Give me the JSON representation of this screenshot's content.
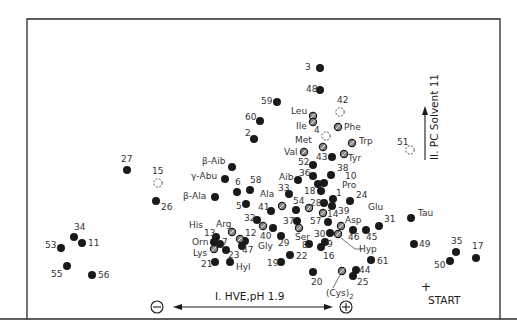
{
  "diagram": {
    "type": "two-dimensional amino acid fingerprint map (HVE x paper chromatography)",
    "axis_x": {
      "label": "I. HVE,pH 1.9",
      "negative_pole": "−",
      "positive_pole": "+"
    },
    "axis_y": {
      "label": "II. PC Solvent 11"
    },
    "origin": {
      "marker": "+",
      "label": "START"
    },
    "legend_styles": {
      "filled": "solid black spot",
      "hatched": "grey hatched spot (reference amino acids)",
      "dashed": "dotted outline spot (faint)"
    },
    "spots": [
      {
        "id": "3",
        "label": "3",
        "x": 320,
        "y": 68,
        "style": "filled",
        "lx": 305,
        "ly": 70
      },
      {
        "id": "48",
        "label": "48",
        "x": 320,
        "y": 90,
        "style": "filled",
        "lx": 306,
        "ly": 92
      },
      {
        "id": "59",
        "label": "59",
        "x": 277,
        "y": 102,
        "style": "filled",
        "lx": 261,
        "ly": 104
      },
      {
        "id": "60",
        "label": "60",
        "x": 260,
        "y": 121,
        "style": "filled",
        "lx": 245,
        "ly": 120
      },
      {
        "id": "2",
        "label": "2",
        "x": 254,
        "y": 139,
        "style": "filled",
        "lx": 245,
        "ly": 136
      },
      {
        "id": "42",
        "label": "42",
        "x": 340,
        "y": 112,
        "style": "dashed",
        "lx": 337,
        "ly": 103
      },
      {
        "id": "Leu",
        "label": "Leu",
        "x": 313,
        "y": 116,
        "style": "hatched",
        "lx": 291,
        "ly": 114
      },
      {
        "id": "Ile",
        "label": "Ile",
        "x": 313,
        "y": 122,
        "style": "hatched",
        "lx": 296,
        "ly": 129
      },
      {
        "id": "4",
        "label": "4",
        "x": 326,
        "y": 136,
        "style": "dashed",
        "lx": 314,
        "ly": 133
      },
      {
        "id": "Phe",
        "label": "Phe",
        "x": 338,
        "y": 127,
        "style": "hatched",
        "lx": 344,
        "ly": 130
      },
      {
        "id": "Met",
        "label": "Met",
        "x": 323,
        "y": 147,
        "style": "hatched",
        "lx": 295,
        "ly": 143
      },
      {
        "id": "Trp",
        "label": "Trp",
        "x": 352,
        "y": 143,
        "style": "hatched",
        "lx": 359,
        "ly": 144
      },
      {
        "id": "Val",
        "label": "Val",
        "x": 304,
        "y": 152,
        "style": "hatched",
        "lx": 284,
        "ly": 155
      },
      {
        "id": "43",
        "label": "43",
        "x": 332,
        "y": 157,
        "style": "filled",
        "lx": 316,
        "ly": 160
      },
      {
        "id": "Tyr",
        "label": "Tyr",
        "x": 344,
        "y": 154,
        "style": "hatched",
        "lx": 348,
        "ly": 161
      },
      {
        "id": "51",
        "label": "51",
        "x": 410,
        "y": 150,
        "style": "dashed",
        "lx": 397,
        "ly": 145
      },
      {
        "id": "52",
        "label": "52",
        "x": 313,
        "y": 165,
        "style": "filled",
        "lx": 298,
        "ly": 165
      },
      {
        "id": "38",
        "label": "38",
        "x": 331,
        "y": 175,
        "style": "filled",
        "lx": 337,
        "ly": 171
      },
      {
        "id": "36",
        "label": "36",
        "x": 313,
        "y": 176,
        "style": "filled",
        "lx": 299,
        "ly": 176
      },
      {
        "id": "10",
        "label": "10",
        "x": 0,
        "y": 0,
        "style": "none",
        "lx": 345,
        "ly": 179
      },
      {
        "id": "Aib",
        "label": "Aib",
        "x": 298,
        "y": 180,
        "style": "filled",
        "lx": 279,
        "ly": 180
      },
      {
        "id": "a1",
        "label": "",
        "x": 318,
        "y": 184,
        "style": "filled"
      },
      {
        "id": "a2",
        "label": "",
        "x": 324,
        "y": 183,
        "style": "filled"
      },
      {
        "id": "Pro",
        "label": "Pro",
        "x": 0,
        "y": 0,
        "style": "none",
        "lx": 342,
        "ly": 188
      },
      {
        "id": "18",
        "label": "18",
        "x": 321,
        "y": 191,
        "style": "filled",
        "lx": 304,
        "ly": 194
      },
      {
        "id": "33",
        "label": "33",
        "x": 289,
        "y": 194,
        "style": "filled",
        "lx": 278,
        "ly": 191
      },
      {
        "id": "1",
        "label": "1",
        "x": 333,
        "y": 199,
        "style": "filled",
        "lx": 336,
        "ly": 196
      },
      {
        "id": "24",
        "label": "24",
        "x": 350,
        "y": 201,
        "style": "filled",
        "lx": 356,
        "ly": 198
      },
      {
        "id": "Ala",
        "label": "Ala",
        "x": 0,
        "y": 0,
        "style": "none",
        "lx": 260,
        "ly": 197
      },
      {
        "id": "28",
        "label": "28",
        "x": 324,
        "y": 203,
        "style": "filled",
        "lx": 310,
        "ly": 206
      },
      {
        "id": "54",
        "label": "54",
        "x": 296,
        "y": 210,
        "style": "filled",
        "lx": 293,
        "ly": 204
      },
      {
        "id": "p1",
        "label": "",
        "x": 309,
        "y": 208,
        "style": "hatched"
      },
      {
        "id": "39",
        "label": "39",
        "x": 332,
        "y": 206,
        "style": "filled",
        "lx": 338,
        "ly": 214
      },
      {
        "id": "p2",
        "label": "",
        "x": 323,
        "y": 213,
        "style": "hatched"
      },
      {
        "id": "Glu",
        "label": "Glu",
        "x": 0,
        "y": 0,
        "style": "none",
        "lx": 368,
        "ly": 210
      },
      {
        "id": "6",
        "label": "6",
        "x": 237,
        "y": 192,
        "style": "filled",
        "lx": 235,
        "ly": 185
      },
      {
        "id": "58",
        "label": "58",
        "x": 250,
        "y": 190,
        "style": "filled",
        "lx": 250,
        "ly": 183
      },
      {
        "id": "beta-Aib",
        "label": "β-Aib",
        "x": 232,
        "y": 167,
        "style": "filled",
        "lx": 202,
        "ly": 164
      },
      {
        "id": "gamma-Abu",
        "label": "γ-Abu",
        "x": 225,
        "y": 179,
        "style": "filled",
        "lx": 191,
        "ly": 179
      },
      {
        "id": "beta-Ala",
        "label": "β-Ala",
        "x": 215,
        "y": 197,
        "style": "filled",
        "lx": 183,
        "ly": 199
      },
      {
        "id": "5",
        "label": "5",
        "x": 246,
        "y": 204,
        "style": "filled",
        "lx": 236,
        "ly": 209
      },
      {
        "id": "41",
        "label": "41",
        "x": 271,
        "y": 211,
        "style": "filled",
        "lx": 258,
        "ly": 210
      },
      {
        "id": "Ala-spot",
        "label": "",
        "x": 282,
        "y": 206,
        "style": "hatched"
      },
      {
        "id": "27",
        "label": "27",
        "x": 127,
        "y": 170,
        "style": "filled",
        "lx": 121,
        "ly": 162
      },
      {
        "id": "15",
        "label": "15",
        "x": 158,
        "y": 183,
        "style": "dashed",
        "lx": 152,
        "ly": 174
      },
      {
        "id": "26",
        "label": "26",
        "x": 156,
        "y": 201,
        "style": "filled",
        "lx": 161,
        "ly": 210
      },
      {
        "id": "32",
        "label": "32",
        "x": 257,
        "y": 220,
        "style": "filled",
        "lx": 244,
        "ly": 221
      },
      {
        "id": "37",
        "label": "37",
        "x": 297,
        "y": 221,
        "style": "filled",
        "lx": 283,
        "ly": 224
      },
      {
        "id": "57",
        "label": "57",
        "x": 0,
        "y": 0,
        "style": "none",
        "lx": 310,
        "ly": 224
      },
      {
        "id": "c1",
        "label": "",
        "x": 263,
        "y": 226,
        "style": "hatched"
      },
      {
        "id": "c2",
        "label": "",
        "x": 299,
        "y": 228,
        "style": "hatched"
      },
      {
        "id": "14",
        "label": "14",
        "x": 328,
        "y": 222,
        "style": "filled",
        "lx": 327,
        "ly": 217
      },
      {
        "id": "Asp",
        "label": "Asp",
        "x": 341,
        "y": 226,
        "style": "hatched",
        "lx": 345,
        "ly": 223
      },
      {
        "id": "31",
        "label": "31",
        "x": 379,
        "y": 226,
        "style": "filled",
        "lx": 384,
        "ly": 222
      },
      {
        "id": "Ser",
        "label": "Ser",
        "x": 0,
        "y": 0,
        "style": "none",
        "lx": 295,
        "ly": 240
      },
      {
        "id": "40",
        "label": "40",
        "x": 273,
        "y": 228,
        "style": "filled",
        "lx": 260,
        "ly": 239
      },
      {
        "id": "29",
        "label": "29",
        "x": 281,
        "y": 236,
        "style": "filled",
        "lx": 278,
        "ly": 246
      },
      {
        "id": "30",
        "label": "30",
        "x": 330,
        "y": 233,
        "style": "filled",
        "lx": 314,
        "ly": 237
      },
      {
        "id": "Hyp",
        "label": "Hyp",
        "x": 338,
        "y": 234,
        "style": "hatched",
        "lx": 359,
        "ly": 252
      },
      {
        "id": "46",
        "label": "46",
        "x": 353,
        "y": 230,
        "style": "filled",
        "lx": 348,
        "ly": 240
      },
      {
        "id": "45",
        "label": "45",
        "x": 366,
        "y": 230,
        "style": "filled",
        "lx": 366,
        "ly": 240
      },
      {
        "id": "8",
        "label": "8",
        "x": 309,
        "y": 244,
        "style": "filled",
        "lx": 302,
        "ly": 248
      },
      {
        "id": "9",
        "label": "9",
        "x": 325,
        "y": 242,
        "style": "filled",
        "lx": 327,
        "ly": 247
      },
      {
        "id": "16",
        "label": "16",
        "x": 321,
        "y": 247,
        "style": "filled",
        "lx": 323,
        "ly": 259
      },
      {
        "id": "22",
        "label": "22",
        "x": 290,
        "y": 255,
        "style": "filled",
        "lx": 296,
        "ly": 259
      },
      {
        "id": "19",
        "label": "19",
        "x": 281,
        "y": 262,
        "style": "filled",
        "lx": 267,
        "ly": 266
      },
      {
        "id": "61",
        "label": "61",
        "x": 371,
        "y": 260,
        "style": "filled",
        "lx": 377,
        "ly": 264
      },
      {
        "id": "44",
        "label": "44",
        "x": 356,
        "y": 270,
        "style": "filled",
        "lx": 359,
        "ly": 273
      },
      {
        "id": "25",
        "label": "25",
        "x": 353,
        "y": 276,
        "style": "filled",
        "lx": 357,
        "ly": 285
      },
      {
        "id": "Cys2",
        "label": "(Cys)2",
        "x": 342,
        "y": 271,
        "style": "hatched",
        "lx": 326,
        "ly": 296
      },
      {
        "id": "20",
        "label": "20",
        "x": 313,
        "y": 272,
        "style": "filled",
        "lx": 311,
        "ly": 285
      },
      {
        "id": "His",
        "label": "His",
        "x": 0,
        "y": 0,
        "style": "none",
        "lx": 189,
        "ly": 228
      },
      {
        "id": "Arg",
        "label": "Arg",
        "x": 232,
        "y": 232,
        "style": "hatched",
        "lx": 216,
        "ly": 227
      },
      {
        "id": "13",
        "label": "13",
        "x": 216,
        "y": 237,
        "style": "filled",
        "lx": 204,
        "ly": 236
      },
      {
        "id": "12",
        "label": "12",
        "x": 245,
        "y": 241,
        "style": "filled",
        "lx": 245,
        "ly": 236
      },
      {
        "id": "d1",
        "label": "",
        "x": 240,
        "y": 239,
        "style": "hatched"
      },
      {
        "id": "Orn",
        "label": "Orn",
        "x": 214,
        "y": 242,
        "style": "filled",
        "lx": 192,
        "ly": 245
      },
      {
        "id": "7",
        "label": "7",
        "x": 220,
        "y": 244,
        "style": "filled",
        "lx": 222,
        "ly": 245
      },
      {
        "id": "47",
        "label": "47",
        "x": 242,
        "y": 246,
        "style": "filled",
        "lx": 242,
        "ly": 253
      },
      {
        "id": "Lys",
        "label": "Lys",
        "x": 214,
        "y": 249,
        "style": "hatched",
        "lx": 193,
        "ly": 256
      },
      {
        "id": "23",
        "label": "23",
        "x": 226,
        "y": 250,
        "style": "filled",
        "lx": 228,
        "ly": 258
      },
      {
        "id": "Gly",
        "label": "Gly",
        "x": 0,
        "y": 0,
        "style": "none",
        "lx": 258,
        "ly": 249
      },
      {
        "id": "21",
        "label": "21",
        "x": 215,
        "y": 262,
        "style": "filled",
        "lx": 201,
        "ly": 267
      },
      {
        "id": "Hyl",
        "label": "Hyl",
        "x": 230,
        "y": 262,
        "style": "filled",
        "lx": 236,
        "ly": 270
      },
      {
        "id": "34",
        "label": "34",
        "x": 74,
        "y": 237,
        "style": "filled",
        "lx": 74,
        "ly": 230
      },
      {
        "id": "11",
        "label": "11",
        "x": 82,
        "y": 243,
        "style": "filled",
        "lx": 88,
        "ly": 246
      },
      {
        "id": "53",
        "label": "53",
        "x": 61,
        "y": 248,
        "style": "filled",
        "lx": 45,
        "ly": 248
      },
      {
        "id": "55",
        "label": "55",
        "x": 67,
        "y": 266,
        "style": "filled",
        "lx": 51,
        "ly": 277
      },
      {
        "id": "56",
        "label": "56",
        "x": 92,
        "y": 275,
        "style": "filled",
        "lx": 98,
        "ly": 278
      },
      {
        "id": "Tau",
        "label": "Tau",
        "x": 411,
        "y": 218,
        "style": "filled",
        "lx": 418,
        "ly": 216
      },
      {
        "id": "49",
        "label": "49",
        "x": 414,
        "y": 244,
        "style": "filled",
        "lx": 419,
        "ly": 247
      },
      {
        "id": "35",
        "label": "35",
        "x": 456,
        "y": 252,
        "style": "filled",
        "lx": 451,
        "ly": 244
      },
      {
        "id": "50",
        "label": "50",
        "x": 450,
        "y": 261,
        "style": "filled",
        "lx": 434,
        "ly": 268
      },
      {
        "id": "17",
        "label": "17",
        "x": 476,
        "y": 258,
        "style": "filled",
        "lx": 472,
        "ly": 249
      }
    ]
  }
}
